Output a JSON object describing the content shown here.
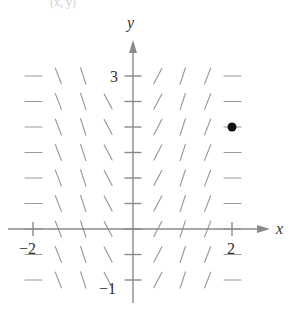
{
  "figure": {
    "type": "slope_field",
    "top_fragment_text": "(x, y)",
    "x_axis_label": "x",
    "y_axis_label": "y",
    "tick_labels": {
      "x": [
        {
          "value": -2,
          "text": "−2"
        },
        {
          "value": 2,
          "text": "2"
        }
      ],
      "y": [
        {
          "value": 3,
          "text": "3"
        },
        {
          "value": -1,
          "text": "−1"
        }
      ]
    },
    "point": {
      "x": 2,
      "y": 2,
      "label": "initial point"
    },
    "colors": {
      "axis": "#8a8a8a",
      "segments": "#9a9a9a",
      "point": "#111111",
      "text": "#333333"
    }
  },
  "chart_data": {
    "type": "slope_field",
    "title": "",
    "xlabel": "x",
    "ylabel": "y",
    "xlim": [
      -2.2,
      2.6
    ],
    "ylim": [
      -1.5,
      3.9
    ],
    "grid_x": [
      -2,
      -1.5,
      -1,
      -0.5,
      0,
      0.5,
      1,
      1.5,
      2
    ],
    "grid_y": [
      -1,
      -0.5,
      0,
      0.5,
      1,
      1.5,
      2,
      2.5,
      3
    ],
    "slopes_by_x": {
      "-2": 0,
      "-1.5": -2.6,
      "-1": -3,
      "-0.5": -1.9,
      "0": 0,
      "0.5": 1.9,
      "1": 3,
      "1.5": 2.6,
      "2": 0
    },
    "slope_note": "segment slopes depend on x only; horizontal at x = -2, 0, 2",
    "highlighted_point": [
      2,
      2
    ]
  }
}
